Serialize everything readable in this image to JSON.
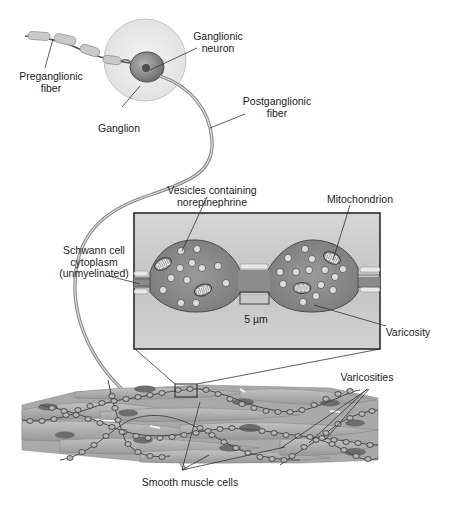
{
  "figure": {
    "colors": {
      "background": "#ffffff",
      "ganglion_fill": "#ececec",
      "neuron_body": "#8f8f8f",
      "nucleus": "#555555",
      "inset_background": "#c9c9c9",
      "axon_fill": "#8a8a8a",
      "vesicle": "#d9d9d9",
      "muscle_cell": "#a8a8a8",
      "muscle_nucleus": "#6a6a6a",
      "leader_line": "#333333"
    }
  },
  "labels": {
    "preganglionic_fiber": [
      "Preganglionic",
      "fiber"
    ],
    "ganglionic_neuron": [
      "Ganglionic",
      "neuron"
    ],
    "ganglion": [
      "Ganglion"
    ],
    "postganglionic_fiber": [
      "Postganglionic",
      "fiber"
    ],
    "vesicles": [
      "Vesicles containing",
      "norepinephrine"
    ],
    "mitochondrion": [
      "Mitochondrion"
    ],
    "schwann_cell": [
      "Schwann cell",
      "cytoplasm",
      "(unmyelinated)"
    ],
    "scale_bar": "5 µm",
    "varicosity": [
      "Varicosity"
    ],
    "varicosities": [
      "Varicosities"
    ],
    "smooth_muscle_cells": [
      "Smooth muscle cells"
    ]
  }
}
